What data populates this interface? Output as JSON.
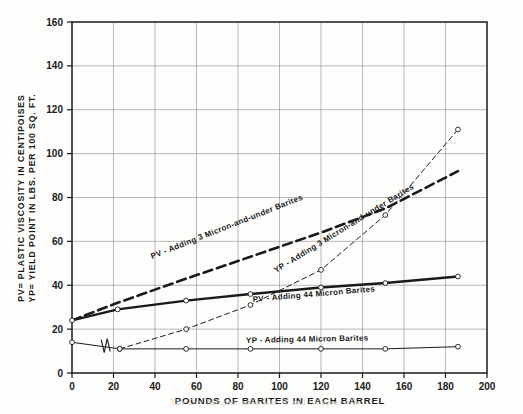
{
  "figure": {
    "axis_y_label_line1": "PV= PLASTIC VISCOSITY IN CENTIPOISES",
    "axis_y_label_line2": "YP= YIELD POINT IN LBS. PER 100 SQ. FT.",
    "axis_x_label": "POUNDS OF BARITES IN EACH BARREL",
    "ink_color": "#1a1a1a",
    "grid_color": "#9a9a9a",
    "page_color": "#fdfdfb"
  },
  "annotations": {
    "pv_3micron": "PV - Adding 3 Micron-and-under Barites",
    "yp_3micron": "YP - Adding 3 Micron-and-under Barites",
    "pv_44micron": "PV - Adding 44 Micron Barites",
    "yp_44micron": "YP - Adding 44 Micron Barites"
  },
  "bleed_through": {
    "caption_ghost": "The Dry Mixture with Icteric and Summerville"
  },
  "chart_data": {
    "type": "line",
    "title": "",
    "xlabel": "POUNDS OF BARITES IN EACH BARREL",
    "ylabel": "PV= PLASTIC VISCOSITY IN CENTIPOISES / YP= YIELD POINT IN LBS. PER 100 SQ. FT.",
    "xlim": [
      0,
      200
    ],
    "ylim": [
      0,
      160
    ],
    "xticks": [
      0,
      20,
      40,
      60,
      80,
      100,
      120,
      140,
      160,
      180,
      200
    ],
    "yticks": [
      0,
      20,
      40,
      60,
      80,
      100,
      120,
      140,
      160
    ],
    "grid": true,
    "legend": "inline-annotations",
    "series": [
      {
        "name": "PV - Adding 3 Micron-and-under Barites",
        "style": "heavy-dashed",
        "markers": false,
        "points": [
          [
            0,
            24
          ],
          [
            22,
            32
          ],
          [
            55,
            43
          ],
          [
            86,
            53
          ],
          [
            120,
            64
          ],
          [
            151,
            75
          ],
          [
            186,
            92
          ]
        ]
      },
      {
        "name": "YP - Adding 3 Micron-and-under Barites",
        "style": "thin-dashed",
        "markers": true,
        "points": [
          [
            23,
            11
          ],
          [
            55,
            20
          ],
          [
            86,
            31
          ],
          [
            120,
            47
          ],
          [
            151,
            72
          ],
          [
            186,
            111
          ]
        ]
      },
      {
        "name": "PV - Adding 44 Micron Barites",
        "style": "heavy-solid",
        "markers": true,
        "points": [
          [
            0,
            24
          ],
          [
            22,
            29
          ],
          [
            55,
            33
          ],
          [
            86,
            36
          ],
          [
            120,
            39
          ],
          [
            151,
            41
          ],
          [
            186,
            44
          ]
        ]
      },
      {
        "name": "YP - Adding 44 Micron Barites",
        "style": "thin-solid",
        "markers": true,
        "axis_break_at_x": 16,
        "points": [
          [
            0,
            14
          ],
          [
            23,
            11
          ],
          [
            55,
            11
          ],
          [
            86,
            11
          ],
          [
            120,
            11
          ],
          [
            151,
            11
          ],
          [
            186,
            12
          ]
        ]
      }
    ]
  }
}
